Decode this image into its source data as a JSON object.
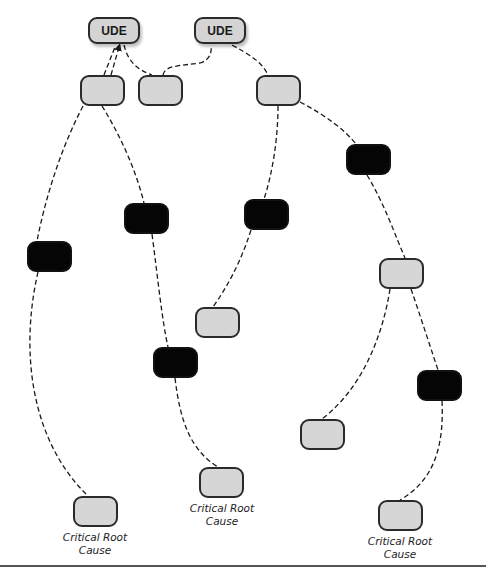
{
  "diagram": {
    "type": "current-reality-tree",
    "colors": {
      "gray_node": "#d6d6d6",
      "black_node": "#050505",
      "border": "#2a2a2a",
      "link": "#1a1a1a"
    },
    "nodes": [
      {
        "id": "ude1",
        "kind": "ude",
        "label": "UDE",
        "x": 88,
        "y": 17,
        "w": 52,
        "h": 27
      },
      {
        "id": "ude2",
        "kind": "ude",
        "label": "UDE",
        "x": 194,
        "y": 17,
        "w": 52,
        "h": 27
      },
      {
        "id": "a",
        "kind": "gray",
        "x": 80,
        "y": 75,
        "w": 45,
        "h": 31
      },
      {
        "id": "b",
        "kind": "gray",
        "x": 138,
        "y": 75,
        "w": 45,
        "h": 31
      },
      {
        "id": "e",
        "kind": "gray",
        "x": 256,
        "y": 75,
        "w": 45,
        "h": 31
      },
      {
        "id": "f",
        "kind": "black",
        "x": 346,
        "y": 144,
        "w": 45,
        "h": 31
      },
      {
        "id": "g",
        "kind": "black",
        "x": 244,
        "y": 199,
        "w": 45,
        "h": 31
      },
      {
        "id": "c",
        "kind": "black",
        "x": 124,
        "y": 203,
        "w": 45,
        "h": 31
      },
      {
        "id": "d",
        "kind": "black",
        "x": 27,
        "y": 241,
        "w": 45,
        "h": 31
      },
      {
        "id": "h",
        "kind": "gray",
        "x": 379,
        "y": 258,
        "w": 45,
        "h": 31
      },
      {
        "id": "i",
        "kind": "gray",
        "x": 195,
        "y": 307,
        "w": 45,
        "h": 31
      },
      {
        "id": "j",
        "kind": "black",
        "x": 153,
        "y": 347,
        "w": 45,
        "h": 31
      },
      {
        "id": "k",
        "kind": "black",
        "x": 417,
        "y": 370,
        "w": 45,
        "h": 31
      },
      {
        "id": "l",
        "kind": "gray",
        "x": 300,
        "y": 419,
        "w": 45,
        "h": 31
      },
      {
        "id": "n",
        "kind": "gray",
        "x": 199,
        "y": 467,
        "w": 45,
        "h": 31
      },
      {
        "id": "m",
        "kind": "gray",
        "x": 73,
        "y": 496,
        "w": 45,
        "h": 31
      },
      {
        "id": "o",
        "kind": "gray",
        "x": 378,
        "y": 500,
        "w": 45,
        "h": 31
      }
    ],
    "root_cause_labels": [
      {
        "for": "m",
        "line1": "Critical Root",
        "line2": "Cause",
        "x": 50,
        "y": 531
      },
      {
        "for": "n",
        "line1": "Critical Root",
        "line2": "Cause",
        "x": 177,
        "y": 502
      },
      {
        "for": "o",
        "line1": "Critical Root",
        "line2": "Cause",
        "x": 355,
        "y": 535
      }
    ],
    "links": [
      {
        "d": "M111,75 L119,47"
      },
      {
        "d": "M104,75 L115,47"
      },
      {
        "d": "M124,45 C128,62 138,70 152,75"
      },
      {
        "d": "M163,75 C165,65 180,66 200,63 C210,60 212,52 211,45"
      },
      {
        "d": "M232,45 C250,55 262,62 268,75"
      },
      {
        "d": "M83,106 C60,150 45,200 37,241"
      },
      {
        "d": "M102,106 C120,135 136,170 144,203"
      },
      {
        "d": "M38,272 C20,350 30,440 88,496"
      },
      {
        "d": "M152,234 C158,280 162,320 168,347"
      },
      {
        "d": "M175,378 C180,420 190,450 218,467"
      },
      {
        "d": "M278,106 C278,140 272,175 264,199"
      },
      {
        "d": "M251,230 C240,265 225,290 213,307"
      },
      {
        "d": "M300,102 C325,115 345,130 356,144"
      },
      {
        "d": "M367,175 C385,205 395,235 405,258"
      },
      {
        "d": "M390,289 C382,340 360,390 322,419"
      },
      {
        "d": "M411,289 C420,315 428,340 438,370"
      },
      {
        "d": "M442,401 C444,445 435,480 400,500"
      }
    ]
  }
}
